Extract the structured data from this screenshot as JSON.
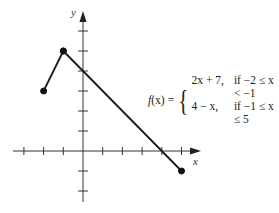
{
  "chart_data": {
    "type": "line",
    "title": "",
    "xlabel": "x",
    "ylabel": "y",
    "xlim": [
      -3,
      6
    ],
    "ylim": [
      -3,
      7
    ],
    "grid": false,
    "axis_ticks": {
      "x": [
        -3,
        -2,
        -1,
        1,
        2,
        3,
        4,
        5
      ],
      "y": [
        -2,
        -1,
        1,
        2,
        3,
        4,
        5,
        6
      ]
    },
    "series": [
      {
        "name": "2x + 7",
        "domain": "-2 <= x < -1",
        "points": [
          [
            -2,
            3
          ],
          [
            -1,
            5
          ]
        ],
        "endpoints": [
          "closed",
          "closed"
        ]
      },
      {
        "name": "4 - x",
        "domain": "-1 <= x <= 5",
        "points": [
          [
            -1,
            5
          ],
          [
            5,
            -1
          ]
        ],
        "endpoints": [
          "closed",
          "closed"
        ]
      }
    ],
    "annotations": [
      {
        "text": "f(x) = { 2x + 7, if -2 ≤ x < -1 ; 4 - x, if -1 ≤ x ≤ 5 }"
      }
    ],
    "colors": {
      "line": "#1a1a1a",
      "axis": "#333333"
    }
  },
  "equation": {
    "lhs_f": "f",
    "lhs_paren": "(x)",
    "equals": "=",
    "brace": "{",
    "cases": [
      {
        "expr": "2x + 7,",
        "cond": "if −2 ≤ x < −1"
      },
      {
        "expr": "4 − x,",
        "cond": "if −1 ≤ x ≤ 5"
      }
    ]
  },
  "axes": {
    "x_label": "x",
    "y_label": "y"
  }
}
